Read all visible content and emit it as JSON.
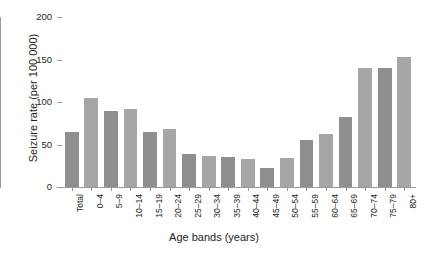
{
  "chart_data": {
    "type": "bar",
    "title": "",
    "xlabel": "Age bands (years)",
    "ylabel": "Seizure rate (per 100 000)",
    "ylim": [
      0,
      200
    ],
    "yticks": [
      0,
      50,
      100,
      150,
      200
    ],
    "grid": false,
    "legend": null,
    "bar_color": "#8f8f8f",
    "bar_color_alt": "#a6a6a6",
    "categories": [
      "Total",
      "0–4",
      "5–9",
      "10–14",
      "15–19",
      "20–24",
      "25–29",
      "30–34",
      "35–39",
      "40–44",
      "45–49",
      "50–54",
      "55–59",
      "60–64",
      "65–69",
      "70–74",
      "75–79",
      "80+"
    ],
    "values": [
      65,
      105,
      90,
      92,
      65,
      68,
      39,
      36,
      35,
      33,
      22,
      34,
      55,
      62,
      82,
      140,
      140,
      153
    ]
  },
  "axis": {
    "y_title": "Seizure rate (per 100 000)",
    "x_title": "Age bands (years)",
    "y_tick_labels": [
      "0",
      "50",
      "100",
      "150",
      "200"
    ]
  }
}
